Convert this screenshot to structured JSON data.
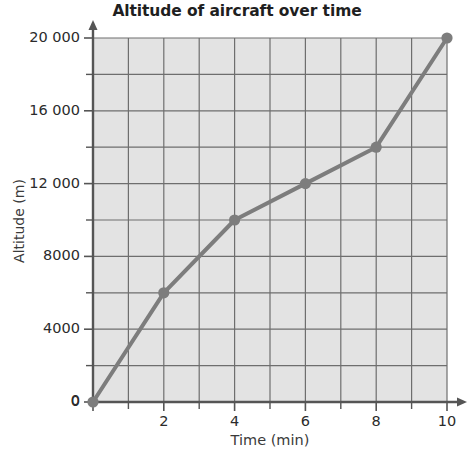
{
  "chart_data": {
    "type": "line",
    "title": "Altitude of aircraft over time",
    "xlabel": "Time (min)",
    "ylabel": "Altitude (m)",
    "x": [
      0,
      2,
      4,
      6,
      8,
      10
    ],
    "values": [
      0,
      6000,
      10000,
      12000,
      14000,
      20000
    ],
    "series": [
      {
        "name": "Altitude",
        "x": [
          0,
          2,
          4,
          6,
          8,
          10
        ],
        "values": [
          0,
          6000,
          10000,
          12000,
          14000,
          20000
        ]
      }
    ],
    "points": [
      {
        "x": 0,
        "y": 0
      },
      {
        "x": 2,
        "y": 6000
      },
      {
        "x": 4,
        "y": 10000
      },
      {
        "x": 6,
        "y": 12000
      },
      {
        "x": 8,
        "y": 14000
      },
      {
        "x": 10,
        "y": 20000
      }
    ],
    "xlim": [
      0,
      10
    ],
    "ylim": [
      0,
      20000
    ],
    "x_major_ticks": [
      0,
      2,
      4,
      6,
      8,
      10
    ],
    "x_minor_ticks": [
      1,
      3,
      5,
      7,
      9
    ],
    "x_tick_labels": [
      "0",
      "2",
      "4",
      "6",
      "8",
      "10"
    ],
    "y_major_ticks": [
      0,
      4000,
      8000,
      12000,
      16000,
      20000
    ],
    "y_minor_ticks": [
      2000,
      6000,
      10000,
      14000,
      18000
    ],
    "y_tick_labels": [
      "0",
      "4000",
      "8000",
      "12 000",
      "16 000",
      "20 000"
    ],
    "grid": true,
    "grid_x_step": 1,
    "grid_y_step": 2000,
    "legend": "none",
    "colors": {
      "plot_background": "#e3e3e3",
      "gridline": "#6e6e6e",
      "axis": "#555555",
      "series_line": "#7d7d7d",
      "marker": "#7d7d7d",
      "text": "#2b2b2b",
      "page_background": "#ffffff"
    }
  }
}
